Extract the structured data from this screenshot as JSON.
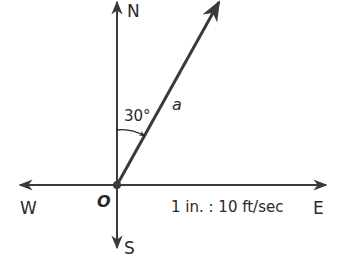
{
  "diagram": {
    "type": "vector-diagram",
    "axes": {
      "north_label": "N",
      "south_label": "S",
      "east_label": "E",
      "west_label": "W"
    },
    "origin_label": "O",
    "vector": {
      "label": "a",
      "angle_label": "30°",
      "angle_from": "N",
      "direction": "toward E"
    },
    "scale_label": "1 in. : 10 ft/sec",
    "colors": {
      "line": "#3a3a3a",
      "text": "#2a2a2a",
      "background": "#ffffff"
    }
  }
}
